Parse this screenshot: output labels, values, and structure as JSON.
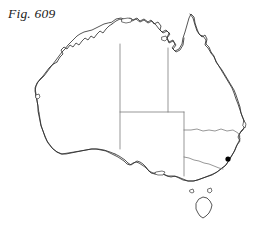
{
  "figure": {
    "caption": "Fig. 609",
    "background_color": "#ffffff",
    "coast_color": "#2b2b2b",
    "border_color": "#6b6b6b",
    "marker_color": "#000000"
  },
  "map": {
    "region_name": "Australia",
    "projection_note": "outline map, no graticule, no labels",
    "viewbox": "0 0 255 227",
    "mainland": {
      "name": "Australian mainland",
      "path": "M 112 22 L 116 19 L 121 18 L 126 20 L 130 18 L 133 20 L 137 18 L 140 21 L 144 19 L 148 22 L 151 20 L 154 24 L 158 22 L 161 26 L 160 30 L 163 33 L 167 31 L 170 34 L 167 38 L 169 42 L 173 40 L 175 44 L 172 48 L 175 51 L 179 49 L 182 44 L 183 38 L 185 32 L 187 25 L 189 18 L 191 14 L 194 17 L 195 23 L 197 29 L 199 34 L 202 37 L 205 35 L 207 39 L 206 44 L 209 47 L 211 52 L 214 56 L 216 62 L 219 66 L 222 70 L 225 75 L 228 80 L 231 85 L 234 90 L 236 95 L 238 101 L 240 107 L 241 113 L 243 118 L 245 123 L 244 128 L 241 131 L 239 135 L 240 139 L 238 143 L 236 147 L 234 152 L 231 157 L 228 162 L 225 166 L 221 169 L 217 172 L 213 174 L 208 176 L 203 178 L 198 180 L 193 181 L 188 181 L 183 180 L 179 178 L 175 176 L 171 177 L 167 176 L 163 174 L 159 173 L 155 174 L 151 173 L 148 170 L 145 167 L 142 165 L 139 163 L 136 162 L 133 163 L 130 165 L 127 164 L 124 161 L 121 159 L 118 157 L 114 155 L 110 153 L 106 151 L 101 150 L 96 149 L 91 149 L 86 150 L 81 151 L 76 152 L 71 153 L 66 154 L 61 154 L 57 152 L 53 149 L 50 145 L 47 141 L 45 136 L 43 131 L 41 126 L 40 121 L 39 116 L 38 111 L 38 106 L 37 101 L 36 96 L 35 91 L 36 86 L 38 82 L 41 79 L 44 76 L 47 72 L 50 68 L 53 64 L 56 60 L 59 56 L 62 52 L 65 49 L 68 45 L 71 42 L 74 39 L 77 36 L 80 34 L 84 32 L 88 31 L 92 30 L 96 28 L 100 26 L 104 24 L 108 23 Z"
    },
    "coast_segments": [
      {
        "name": "kimberley-northwest-coast",
        "path": "M 57 62 L 60 57 L 63 54 L 61 50 L 64 47 L 67 49 L 70 45 L 73 47 L 76 43 L 79 45 L 82 41 L 85 38 L 88 40 L 91 36 L 94 38 L 97 34 L 100 31 L 103 33 L 106 29 L 109 26 L 112 24"
      },
      {
        "name": "arnhem-land-coast",
        "path": "M 112 24 L 116 21 L 120 19 L 124 21 L 128 19 L 132 21 L 136 19 L 140 22 L 144 20 L 148 23 L 152 21 L 156 25 L 159 29 L 162 32 L 166 30 L 169 33"
      },
      {
        "name": "gulf-of-carpentaria-coast",
        "path": "M 169 33 L 167 38 L 169 43 L 173 41 L 176 45 L 173 49 L 176 52 L 180 50 L 183 45 L 184 38"
      },
      {
        "name": "cape-york-east-coast",
        "path": "M 190 14 L 193 18 L 195 25 L 197 31 L 200 35 L 203 36 L 206 40 L 205 45 L 208 48 L 211 53"
      },
      {
        "name": "queensland-east-coast",
        "path": "M 211 53 L 214 57 L 217 63 L 220 68 L 223 73 L 226 78 L 229 83 L 232 88 L 234 93 L 236 99 L 238 104 L 240 110 L 242 116 L 244 121 L 245 126"
      },
      {
        "name": "new-south-wales-east-coast",
        "path": "M 245 126 L 243 130 L 240 133 L 238 137 L 240 141 L 237 145 L 235 150 L 232 155 L 229 160 L 226 165 L 222 168"
      },
      {
        "name": "victoria-south-coast",
        "path": "M 222 168 L 217 172 L 212 175 L 206 177 L 200 179 L 194 181 L 188 181 L 183 179 L 178 177 L 173 176 L 168 176 L 163 174 L 158 173 L 153 173 L 149 171"
      },
      {
        "name": "south-australia-gulfs-coast",
        "path": "M 149 171 L 146 167 L 143 164 L 140 162 L 137 161 L 134 163 L 131 165 L 128 163 L 125 160 L 122 158 L 119 156 L 115 154"
      },
      {
        "name": "great-australian-bight-coast",
        "path": "M 115 154 L 110 152 L 104 150 L 98 149 L 92 149 L 86 150 L 80 151 L 74 152 L 68 153 L 62 154 L 57 152"
      },
      {
        "name": "southwest-western-australia-coast",
        "path": "M 57 152 L 52 148 L 48 143 L 45 137 L 43 131 L 41 125 L 40 119 L 39 113"
      },
      {
        "name": "west-western-australia-coast",
        "path": "M 39 113 L 38 107 L 37 100 L 36 94 L 35 88 L 37 83 L 40 79 L 43 76 L 46 72 L 49 68 L 52 65 L 57 62"
      }
    ],
    "islands": [
      {
        "name": "tasmania",
        "path": "M 199 199 L 203 197 L 207 198 L 210 201 L 212 205 L 211 209 L 209 213 L 206 216 L 203 218 L 200 216 L 198 213 L 196 209 L 196 204 Z"
      },
      {
        "name": "melville-island",
        "path": "M 122 19 L 128 18 L 132 19 L 131 22 L 126 23 L 122 22 Z"
      },
      {
        "name": "groote-eylandt",
        "path": "M 162 37 L 166 36 L 167 39 L 165 41 L 162 40 Z"
      },
      {
        "name": "kangaroo-island",
        "path": "M 156 172 L 162 171 L 165 172 L 163 175 L 158 175 L 155 174 Z"
      },
      {
        "name": "king-island",
        "path": "M 190 190 L 193 189 L 194 192 L 192 193 L 190 192 Z"
      },
      {
        "name": "flinders-island",
        "path": "M 208 189 L 211 188 L 212 191 L 210 193 L 208 192 Z"
      },
      {
        "name": "dirk-hartog-island",
        "path": "M 36 95 L 39 94 L 40 97 L 38 99 L 36 98 Z"
      },
      {
        "name": "fraser-island",
        "path": "M 244 121 L 246 124 L 245 128 L 243 126 Z"
      }
    ],
    "state_borders": [
      {
        "name": "wa-nt-sa-border-vertical",
        "description": "Western Australia eastern border, 129 degrees east",
        "path": "M 120 44 L 120 149"
      },
      {
        "name": "nt-qld-border-vertical",
        "description": "Northern Territory eastern border, 138 degrees east",
        "path": "M 168 48 L 168 112"
      },
      {
        "name": "nt-sa-border-horizontal",
        "description": "Northern Territory southern border, 26 degrees south",
        "path": "M 120 112 L 184 112"
      },
      {
        "name": "sa-qld-nsw-border-vertical",
        "description": "South Australia eastern border, 141 degrees east",
        "path": "M 184 112 L 184 176"
      },
      {
        "name": "qld-nsw-border",
        "description": "Queensland and New South Wales border, 29 degrees south",
        "path": "M 184 130 L 191 130 L 197 129 L 203 131 L 209 130 L 215 131 L 221 129 L 227 131 L 233 130 L 238 133 L 240 136"
      },
      {
        "name": "nsw-victoria-border-murray-river",
        "description": "Murray River border between New South Wales and Victoria",
        "path": "M 184 157 L 189 158 L 194 160 L 199 161 L 204 163 L 209 164 L 214 166 L 219 168 L 223 169"
      }
    ],
    "markers": [
      {
        "name": "city-dot",
        "cx": 228,
        "cy": 159,
        "r": 2.6,
        "color": "#000000"
      }
    ]
  }
}
